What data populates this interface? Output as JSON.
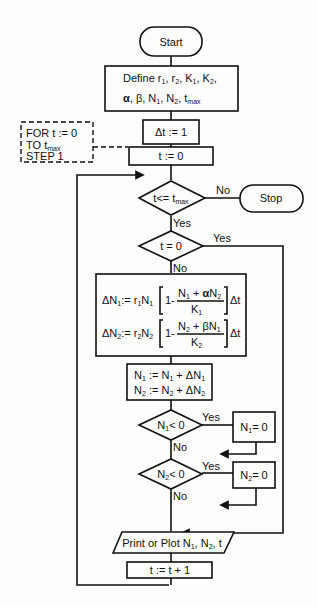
{
  "flowchart": {
    "start": "Start",
    "define": {
      "line1_prefix": "Define",
      "line1": "r1, r2, K1, K2,",
      "line2": "α, β, N1, N2, tmax"
    },
    "dt": "Δt := 1",
    "t0": "t := 0",
    "loop_note": [
      "FOR t := 0",
      "TO tmax",
      "STEP 1"
    ],
    "cond_tmax": "t <= tmax",
    "stop": "Stop",
    "cond_t0": "t = 0",
    "eq1": {
      "lhs": "ΔN1 := r1N1",
      "one": "1-",
      "num": "N1 + αN2",
      "den": "K1",
      "dt": "Δt"
    },
    "eq2": {
      "lhs": "ΔN2 := r2N2",
      "one": "1-",
      "num": "N2 + βN1",
      "den": "K2",
      "dt": "Δt"
    },
    "update1": "N1 := N1 + ΔN1",
    "update2": "N2 := N2 + ΔN2",
    "cond_n1": "N1 < 0",
    "set_n1": "N1 = 0",
    "cond_n2": "N2 < 0",
    "set_n2": "N2 = 0",
    "print": "Print or Plot N1, N2, t",
    "increment": "t := t + 1",
    "labels": {
      "yes": "Yes",
      "no": "No"
    }
  }
}
